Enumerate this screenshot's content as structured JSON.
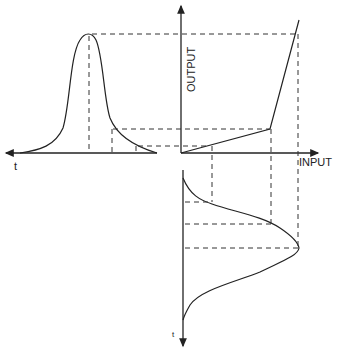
{
  "diagram": {
    "title": "",
    "labels": {
      "output_axis": "OUTPUT",
      "input_axis": "INPUT",
      "time_left": "t",
      "time_bottom": "t"
    },
    "transfer_curve": {
      "segments": [
        "low-slope linear segment from origin",
        "steep linear segment after breakpoint"
      ]
    },
    "colors": {
      "ink": "#222222",
      "background": "#ffffff"
    }
  }
}
